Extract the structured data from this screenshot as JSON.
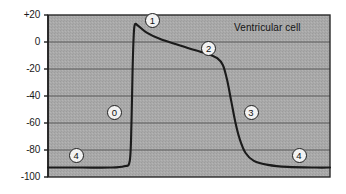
{
  "chart_data": {
    "type": "line",
    "title": "",
    "annotation_label": "Ventricular cell",
    "xlabel": "",
    "ylabel": "",
    "ylim": [
      -100,
      20
    ],
    "yticks": [
      20,
      0,
      -20,
      -40,
      -60,
      -80,
      -100
    ],
    "ytick_labels": [
      "+20",
      "0",
      "-20",
      "-40",
      "-60",
      "-80",
      "-100"
    ],
    "grid": true,
    "grid_axis": "y",
    "xlim": [
      0,
      100
    ],
    "xticks": [],
    "xtick_labels": [],
    "series": [
      {
        "name": "Ventricular action potential",
        "units": "mV",
        "points": [
          [
            0,
            -93
          ],
          [
            12,
            -93
          ],
          [
            22,
            -93
          ],
          [
            27,
            -92
          ],
          [
            29,
            -88
          ],
          [
            29.6,
            -60
          ],
          [
            30.0,
            -20
          ],
          [
            30.4,
            5
          ],
          [
            30.8,
            13
          ],
          [
            32,
            12
          ],
          [
            35,
            7
          ],
          [
            40,
            2
          ],
          [
            46,
            -2
          ],
          [
            52,
            -6
          ],
          [
            57,
            -9
          ],
          [
            60,
            -12
          ],
          [
            62,
            -17
          ],
          [
            63.5,
            -28
          ],
          [
            65,
            -44
          ],
          [
            66.5,
            -60
          ],
          [
            68,
            -72
          ],
          [
            70,
            -82
          ],
          [
            73,
            -88
          ],
          [
            78,
            -91
          ],
          [
            85,
            -92.5
          ],
          [
            95,
            -93
          ],
          [
            100,
            -93
          ]
        ]
      }
    ],
    "phase_markers": [
      {
        "label": "0",
        "x": 23.5,
        "y": -52,
        "description": "phase-0-rapid-depolarization"
      },
      {
        "label": "1",
        "x": 37,
        "y": 16,
        "description": "phase-1-initial-repolarization"
      },
      {
        "label": "2",
        "x": 57,
        "y": -5,
        "description": "phase-2-plateau"
      },
      {
        "label": "3",
        "x": 72,
        "y": -52,
        "description": "phase-3-repolarization"
      },
      {
        "label": "4",
        "x": 10,
        "y": -84,
        "description": "phase-4-resting-left"
      },
      {
        "label": "4",
        "x": 89,
        "y": -84,
        "description": "phase-4-resting-right"
      }
    ],
    "colors": {
      "plot_background": "#a9a9a9",
      "grid_line": "#5a5a5a",
      "trace": "#1b1b1b",
      "axis": "#1f1f1f",
      "text": "#141414",
      "marker_fill": "#f2f2f2"
    }
  }
}
